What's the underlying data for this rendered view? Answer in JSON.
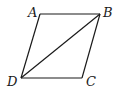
{
  "figure": {
    "type": "parallelogram",
    "vertices": [
      {
        "label": "A",
        "x": 40,
        "y": 14,
        "label_x": 28,
        "label_y": 17
      },
      {
        "label": "B",
        "x": 100,
        "y": 14,
        "label_x": 103,
        "label_y": 17
      },
      {
        "label": "C",
        "x": 82,
        "y": 78,
        "label_x": 86,
        "label_y": 86
      },
      {
        "label": "D",
        "x": 21,
        "y": 78,
        "label_x": 7,
        "label_y": 86
      }
    ],
    "edges": [
      [
        "A",
        "B"
      ],
      [
        "B",
        "C"
      ],
      [
        "C",
        "D"
      ],
      [
        "D",
        "A"
      ]
    ],
    "diagonals": [
      [
        "B",
        "D"
      ]
    ],
    "stroke_color": "#1a1a1a"
  }
}
